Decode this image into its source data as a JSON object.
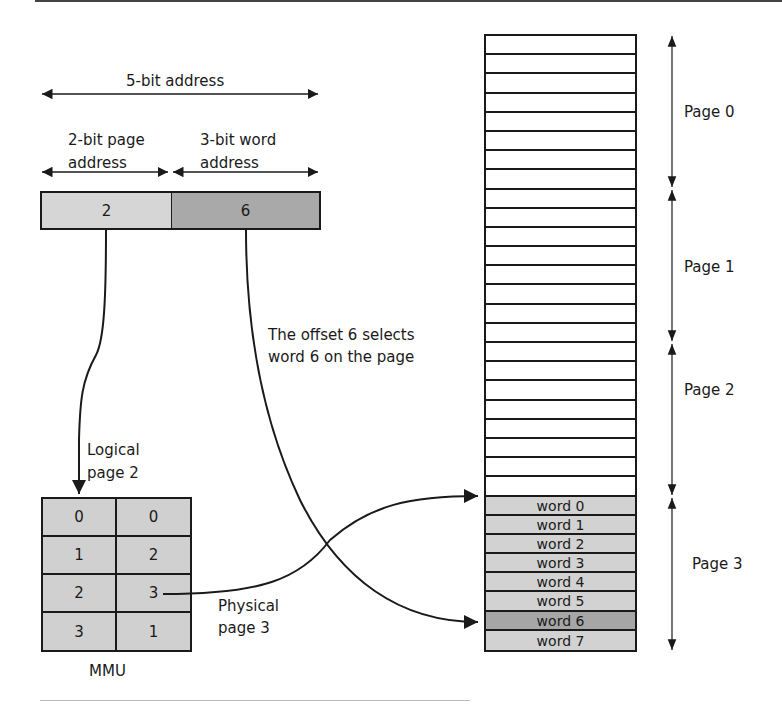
{
  "colors": {
    "line": "#1a1a1a",
    "page_field": "#d6d6d6",
    "word_field": "#a9a9a9",
    "mmu_cell": "#d0d0d0",
    "word_cell": "#d2d2d2",
    "selected_word": "#a6a6a6",
    "empty_cell": "#ffffff"
  },
  "address": {
    "total_label": "5-bit address",
    "page_field_label_line1": "2-bit page",
    "page_field_label_line2": "address",
    "word_field_label_line1": "3-bit word",
    "word_field_label_line2": "address",
    "page_value": "2",
    "word_value": "6"
  },
  "annotations": {
    "offset_line1": "The offset 6 selects",
    "offset_line2": "word 6 on the page",
    "logical_line1": "Logical",
    "logical_line2": "page 2",
    "physical_line1": "Physical",
    "physical_line2": "page 3"
  },
  "mmu": {
    "label": "MMU",
    "rows": [
      {
        "logical": "0",
        "physical": "0"
      },
      {
        "logical": "1",
        "physical": "2"
      },
      {
        "logical": "2",
        "physical": "3"
      },
      {
        "logical": "3",
        "physical": "1"
      }
    ]
  },
  "memory": {
    "pages": [
      {
        "label": "Page 0"
      },
      {
        "label": "Page 1"
      },
      {
        "label": "Page 2"
      },
      {
        "label": "Page 3"
      }
    ],
    "page3_words": [
      "word 0",
      "word 1",
      "word 2",
      "word 3",
      "word 4",
      "word 5",
      "word 6",
      "word 7"
    ],
    "selected_word_index": 6
  }
}
